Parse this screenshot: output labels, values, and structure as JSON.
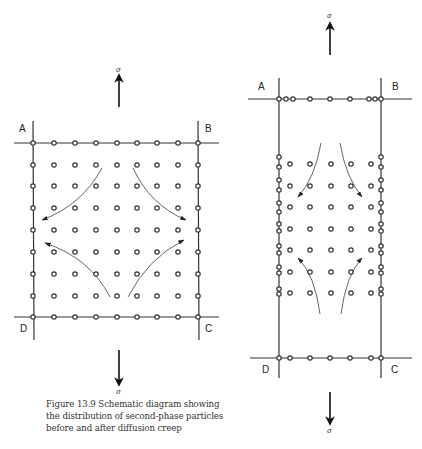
{
  "figure": {
    "caption": "Figure 13.9 Schematic diagram showing the distribution of second-phase particles before and after diffusion creep",
    "caption_lines": [
      "Figure 13.9  Schematic diagram showing",
      "the distribution of second-phase particles",
      "before and after diffusion creep"
    ],
    "stress_symbol": "σ",
    "before": {
      "corner_labels": {
        "top_left": "A",
        "top_right": "B",
        "bottom_left": "D",
        "bottom_right": "C"
      },
      "grid_cols": 9,
      "grid_rows": 9,
      "arrows": 4
    },
    "after": {
      "corner_labels": {
        "top_left": "A",
        "top_right": "B",
        "bottom_left": "D",
        "bottom_right": "C"
      },
      "interior_cols": 5,
      "interior_rows": 7,
      "arrows": 4
    }
  }
}
